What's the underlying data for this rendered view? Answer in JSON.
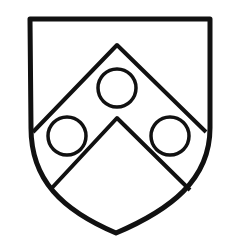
{
  "image": {
    "subject": "heraldic shield",
    "description": "Shield with a chevron charged with three annulets",
    "colors": {
      "line": "#111111",
      "field": "#ffffff"
    }
  }
}
